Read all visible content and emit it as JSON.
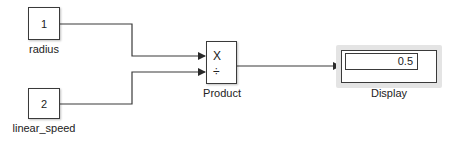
{
  "diagram": {
    "blocks": {
      "inport1": {
        "value": "1",
        "label": "radius"
      },
      "inport2": {
        "value": "2",
        "label": "linear_speed"
      },
      "product": {
        "label": "Product",
        "sign1": "X",
        "sign2": "÷"
      },
      "display": {
        "label": "Display",
        "value": "0.5"
      }
    },
    "signals": [
      {
        "from": "radius",
        "to": "Product.in1"
      },
      {
        "from": "linear_speed",
        "to": "Product.in2"
      },
      {
        "from": "Product",
        "to": "Display"
      }
    ],
    "colors": {
      "line": "#3a3a3a",
      "halo": "#e4e4e4"
    }
  }
}
